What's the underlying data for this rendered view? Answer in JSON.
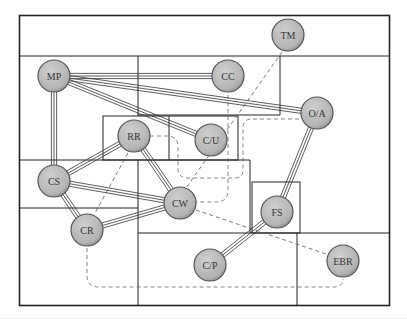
{
  "diagram": {
    "colors": {
      "node_fill": "#b3b3b3",
      "node_stroke": "#555555",
      "line": "#333333",
      "dashed": "#555555",
      "background": "#ffffff"
    },
    "nodes": [
      {
        "id": "TM",
        "label": "TM",
        "x": 288,
        "y": 35
      },
      {
        "id": "MP",
        "label": "MP",
        "x": 54,
        "y": 76
      },
      {
        "id": "CC",
        "label": "CC",
        "x": 228,
        "y": 76
      },
      {
        "id": "OA",
        "label": "O/A",
        "x": 317,
        "y": 113
      },
      {
        "id": "RR",
        "label": "RR",
        "x": 134,
        "y": 136
      },
      {
        "id": "CU",
        "label": "C/U",
        "x": 211,
        "y": 140
      },
      {
        "id": "CS",
        "label": "CS",
        "x": 54,
        "y": 181
      },
      {
        "id": "CW",
        "label": "CW",
        "x": 180,
        "y": 203
      },
      {
        "id": "FS",
        "label": "FS",
        "x": 277,
        "y": 212
      },
      {
        "id": "CR",
        "label": "CR",
        "x": 87,
        "y": 230
      },
      {
        "id": "CP",
        "label": "C/P",
        "x": 210,
        "y": 265
      },
      {
        "id": "EBR",
        "label": "EBR",
        "x": 343,
        "y": 261
      }
    ],
    "strong_links": [
      [
        "MP",
        "CC"
      ],
      [
        "MP",
        "OA"
      ],
      [
        "MP",
        "CU"
      ],
      [
        "MP",
        "CS"
      ],
      [
        "RR",
        "CS"
      ],
      [
        "RR",
        "CW"
      ],
      [
        "CS",
        "CW"
      ],
      [
        "CS",
        "CR"
      ],
      [
        "CR",
        "CW"
      ],
      [
        "OA",
        "FS"
      ],
      [
        "FS",
        "CP"
      ]
    ],
    "weak_links": [
      [
        "TM",
        "CW"
      ],
      [
        "RR",
        "CR"
      ],
      [
        "CW",
        "EBR"
      ]
    ]
  }
}
